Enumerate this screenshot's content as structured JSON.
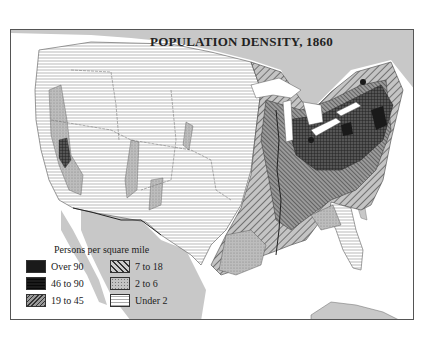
{
  "map": {
    "title": "POPULATION DENSITY, 1860",
    "legend": {
      "title": "Persons per square mile",
      "items": [
        {
          "label": "Over 90",
          "pattern": "solid-black"
        },
        {
          "label": "46 to 90",
          "pattern": "crosshatch"
        },
        {
          "label": "19 to 45",
          "pattern": "dense-diagonal"
        },
        {
          "label": "7 to 18",
          "pattern": "wide-diagonal"
        },
        {
          "label": "2 to 6",
          "pattern": "stipple"
        },
        {
          "label": "Under 2",
          "pattern": "horizontal-lines"
        }
      ]
    },
    "colors": {
      "ocean_canada_mexico": "#c8c8c8",
      "background": "#ffffff",
      "ink": "#222222"
    }
  }
}
